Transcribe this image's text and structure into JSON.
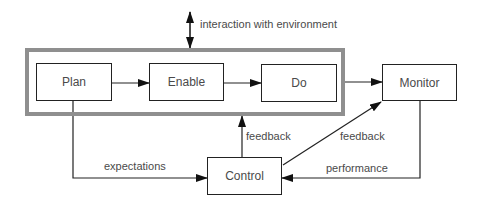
{
  "diagram": {
    "group_frame_color": "#8f8f8f",
    "nodes": [
      {
        "id": "plan",
        "label": "Plan"
      },
      {
        "id": "enable",
        "label": "Enable"
      },
      {
        "id": "do",
        "label": "Do"
      },
      {
        "id": "monitor",
        "label": "Monitor"
      },
      {
        "id": "control",
        "label": "Control"
      }
    ],
    "edge_labels": {
      "environment": "interaction with environment",
      "expectations": "expectations",
      "feedback_to_group": "feedback",
      "feedback_to_monitor": "feedback",
      "performance": "performance"
    },
    "edges": [
      {
        "from": "plan",
        "to": "enable"
      },
      {
        "from": "enable",
        "to": "do"
      },
      {
        "from": "do",
        "to": "monitor"
      },
      {
        "from": "plan",
        "to": "control",
        "label": "expectations"
      },
      {
        "from": "control",
        "to": "plan-enable-do group",
        "label": "feedback"
      },
      {
        "from": "control",
        "to": "monitor",
        "label": "feedback"
      },
      {
        "from": "monitor",
        "to": "control",
        "label": "performance"
      },
      {
        "from": "environment",
        "to": "plan-enable-do group",
        "label": "interaction with environment",
        "bidirectional": true
      }
    ]
  }
}
